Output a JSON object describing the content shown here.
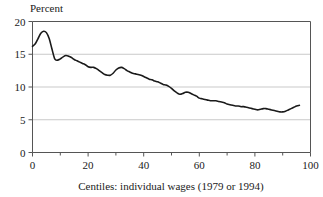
{
  "chart_data": {
    "type": "line",
    "title": "",
    "ylabel": "Percent",
    "xlabel": "Centiles: individual wages (1979 or 1994)",
    "xlim": [
      0,
      100
    ],
    "ylim": [
      0,
      20
    ],
    "xticks": [
      0,
      20,
      40,
      60,
      80,
      100
    ],
    "xtick_labels": [
      "0",
      "20",
      "40",
      "60",
      "80",
      "100"
    ],
    "xminor_ticks": [
      10,
      30,
      50,
      70,
      90
    ],
    "yticks": [
      0,
      5,
      10,
      15,
      20
    ],
    "ytick_labels": [
      "0",
      "5",
      "10",
      "15",
      "20"
    ],
    "grid": "horizontal",
    "gridlines_at": [
      5,
      10,
      15,
      20
    ],
    "legend": "none",
    "line_color": "#1a1a1a",
    "grid_color": "#c9c9c9",
    "axis_color": "#555555",
    "series": [
      {
        "name": "Percent",
        "x": [
          0,
          1,
          2,
          3,
          4,
          5,
          6,
          7,
          8,
          9,
          10,
          11,
          12,
          13,
          14,
          15,
          16,
          17,
          18,
          19,
          20,
          21,
          22,
          23,
          24,
          25,
          26,
          27,
          28,
          29,
          30,
          31,
          32,
          33,
          34,
          35,
          36,
          37,
          38,
          39,
          40,
          41,
          42,
          43,
          44,
          45,
          46,
          47,
          48,
          49,
          50,
          51,
          52,
          53,
          54,
          55,
          56,
          57,
          58,
          59,
          60,
          61,
          62,
          63,
          64,
          65,
          66,
          67,
          68,
          69,
          70,
          71,
          72,
          73,
          74,
          75,
          76,
          77,
          78,
          79,
          80,
          81,
          82,
          83,
          84,
          85,
          86,
          87,
          88,
          89,
          90,
          91,
          92,
          93,
          94,
          95,
          96
        ],
        "values": [
          16.2,
          16.6,
          17.4,
          18.2,
          18.5,
          18.3,
          17.4,
          15.8,
          14.3,
          14.1,
          14.3,
          14.6,
          14.8,
          14.7,
          14.5,
          14.2,
          14.0,
          13.8,
          13.6,
          13.4,
          13.1,
          13.0,
          13.0,
          12.8,
          12.5,
          12.2,
          11.9,
          11.8,
          11.8,
          12.1,
          12.6,
          12.9,
          13.0,
          12.8,
          12.5,
          12.3,
          12.1,
          12.0,
          11.9,
          11.8,
          11.6,
          11.4,
          11.2,
          11.1,
          10.9,
          10.8,
          10.6,
          10.4,
          10.3,
          10.1,
          9.8,
          9.4,
          9.1,
          8.9,
          9.0,
          9.2,
          9.2,
          9.0,
          8.8,
          8.6,
          8.3,
          8.2,
          8.1,
          8.0,
          7.9,
          7.9,
          7.9,
          7.8,
          7.7,
          7.6,
          7.4,
          7.3,
          7.2,
          7.1,
          7.1,
          7.0,
          7.0,
          6.9,
          6.8,
          6.7,
          6.6,
          6.5,
          6.6,
          6.7,
          6.7,
          6.6,
          6.5,
          6.4,
          6.3,
          6.2,
          6.2,
          6.3,
          6.5,
          6.7,
          6.9,
          7.1,
          7.2
        ]
      }
    ]
  }
}
